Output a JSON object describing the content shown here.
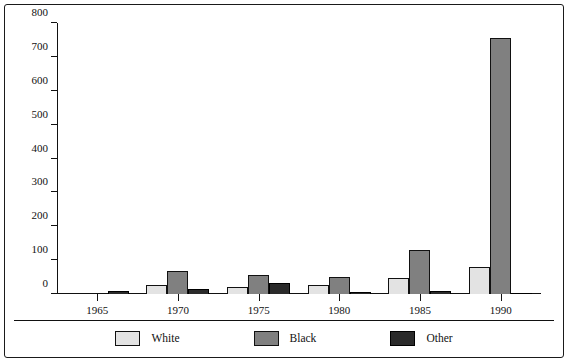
{
  "chart_data": {
    "type": "bar",
    "title": "",
    "subtitle": "",
    "xlabel": "",
    "ylabel": "",
    "categories": [
      "1965",
      "1970",
      "1975",
      "1980",
      "1985",
      "1990"
    ],
    "series": [
      {
        "name": "White",
        "color": "#e3e3e3",
        "values": [
          3,
          26,
          20,
          28,
          48,
          80
        ]
      },
      {
        "name": "Black",
        "color": "#808080",
        "values": [
          4,
          68,
          55,
          50,
          130,
          755
        ]
      },
      {
        "name": "Other",
        "color": "#2a2a2a",
        "values": [
          9,
          15,
          32,
          5,
          8,
          3
        ]
      }
    ],
    "ylim": [
      0,
      800
    ],
    "yticks": [
      0,
      100,
      200,
      300,
      400,
      500,
      600,
      700,
      800
    ],
    "ytick_labels": [
      "0",
      "100",
      "200",
      "300",
      "400",
      "500",
      "600",
      "700",
      "800"
    ],
    "grid": false,
    "legend_position": "bottom"
  }
}
